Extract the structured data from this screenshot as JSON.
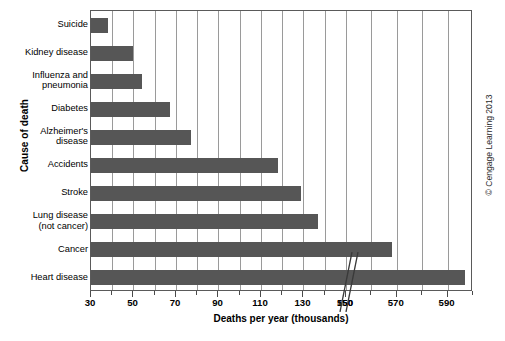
{
  "chart_data": {
    "type": "bar",
    "orientation": "horizontal",
    "title": "",
    "xlabel": "Deaths per year (thousands)",
    "ylabel": "Cause of death",
    "categories": [
      "Suicide",
      "Kidney disease",
      "Influenza and pneumonia",
      "Diabetes",
      "Alzheimer's disease",
      "Accidents",
      "Stroke",
      "Lung disease (not cancer)",
      "Cancer",
      "Heart disease"
    ],
    "values": [
      38,
      50,
      54,
      67,
      77,
      118,
      129,
      137,
      568,
      597
    ],
    "xlim": [
      30,
      150,
      550,
      600
    ],
    "axis_break": true,
    "axis_break_between": [
      150,
      550
    ],
    "xticks": [
      30,
      50,
      70,
      90,
      110,
      130,
      150,
      550,
      570,
      590
    ],
    "xtick_labels": [
      "30",
      "50",
      "70",
      "90",
      "110",
      "130",
      "150",
      "550",
      "570",
      "590"
    ],
    "minor_tick_step": 10,
    "grid": "vertical",
    "legend": "none",
    "bar_color": "#565656",
    "grid_color": "#9a9a9a",
    "axis_color": "#5a5a5a"
  },
  "axes": {
    "y_title": "Cause of death",
    "x_title": "Deaths per year (thousands)",
    "category_labels": [
      {
        "line1": "Suicide",
        "line2": ""
      },
      {
        "line1": "Kidney disease",
        "line2": ""
      },
      {
        "line1": "Influenza and",
        "line2": "pneumonia"
      },
      {
        "line1": "Diabetes",
        "line2": ""
      },
      {
        "line1": "Alzheimer's",
        "line2": "disease"
      },
      {
        "line1": "Accidents",
        "line2": ""
      },
      {
        "line1": "Stroke",
        "line2": ""
      },
      {
        "line1": "Lung disease",
        "line2": "(not cancer)"
      },
      {
        "line1": "Cancer",
        "line2": ""
      },
      {
        "line1": "Heart disease",
        "line2": ""
      }
    ]
  },
  "credit": {
    "text": "© Cengage Learning 2013"
  }
}
